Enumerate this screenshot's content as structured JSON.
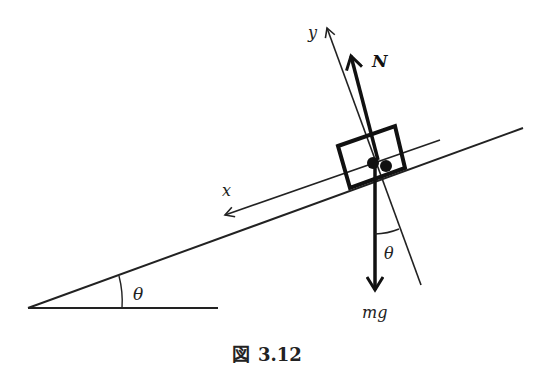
{
  "figure": {
    "caption_prefix": "図",
    "caption_number": "3.12",
    "labels": {
      "y_axis": "y",
      "x_axis": "x",
      "normal_force": "N",
      "weight": "mg",
      "incline_angle": "θ",
      "weight_angle": "θ"
    },
    "colors": {
      "stroke": "#222222",
      "background": "#ffffff"
    }
  }
}
